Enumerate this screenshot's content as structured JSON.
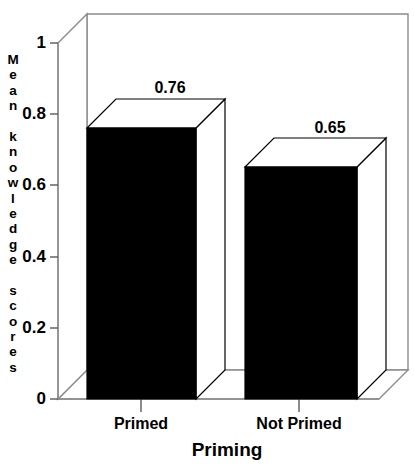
{
  "chart_data": {
    "type": "bar",
    "title": "",
    "subtitle": "",
    "xlabel": "Priming",
    "ylabel": "Mean knowledge scores",
    "categories": [
      "Primed",
      "Not Primed"
    ],
    "values": [
      0.76,
      0.65
    ],
    "value_labels": [
      "0.76",
      "0.65"
    ],
    "ylim": [
      0,
      1
    ],
    "ytick_labels": [
      "1",
      "0.8",
      "0.6",
      "0.4",
      "0.2",
      "0"
    ],
    "ytick_values": [
      1,
      0.8,
      0.6,
      0.4,
      0.2,
      0
    ],
    "grid": false,
    "legend": "none",
    "style": "3d-bar",
    "series": [
      {
        "name": "Mean knowledge scores",
        "values": [
          0.76,
          0.65
        ]
      }
    ],
    "colors": {
      "bar_front": "#000000",
      "bar_top": "#ffffff",
      "bar_side": "#ffffff",
      "outline": "#000000",
      "frame": "#808080",
      "background": "#ffffff",
      "text": "#000000"
    }
  },
  "yaxis_title_glyphs": [
    "M",
    "e",
    "a",
    "n",
    " ",
    "k",
    "n",
    "o",
    "w",
    "l",
    "e",
    "d",
    "g",
    "e",
    " ",
    "s",
    "c",
    "o",
    "r",
    "e",
    "s"
  ]
}
